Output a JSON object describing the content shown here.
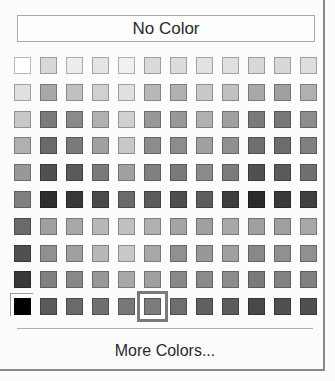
{
  "color_picker": {
    "no_color_label": "No Color",
    "more_colors_label": "More Colors...",
    "selected": {
      "row": 9,
      "col": 5
    },
    "swatches": [
      [
        "#ffffff",
        "#d8d8d8",
        "#ececec",
        "#e4e4e4",
        "#f0f0f0",
        "#dadada",
        "#dcdcdc",
        "#e2e2e2",
        "#e0e0e0",
        "#d8d8d8",
        "#d8d8d8",
        "#dedede"
      ],
      [
        "#e0e0e0",
        "#a8a8a8",
        "#c0c0c0",
        "#d0d0d0",
        "#e0e0e0",
        "#b8b8b8",
        "#b0b0b0",
        "#c8c8c8",
        "#c0c0c0",
        "#a8a8a8",
        "#a0a0a0",
        "#b0b0b0"
      ],
      [
        "#c8c8c8",
        "#7a7a7a",
        "#8a8a8a",
        "#b0b0b0",
        "#d0d0d0",
        "#989898",
        "#989898",
        "#b0b0b0",
        "#a0a0a0",
        "#7a7a7a",
        "#787878",
        "#8c8c8c"
      ],
      [
        "#b0b0b0",
        "#6a6a6a",
        "#7a7a7a",
        "#a0a0a0",
        "#c8c8c8",
        "#8c8c8c",
        "#8c8c8c",
        "#a0a0a0",
        "#909090",
        "#6e6e6e",
        "#6c6c6c",
        "#808080"
      ],
      [
        "#989898",
        "#505050",
        "#5a5a5a",
        "#7a7a7a",
        "#a0a0a0",
        "#808080",
        "#7a7a7a",
        "#8a8a8a",
        "#7c7c7c",
        "#505050",
        "#5a5a5a",
        "#707070"
      ],
      [
        "#808080",
        "#2e2e2e",
        "#383838",
        "#4a4a4a",
        "#6a6a6a",
        "#5c5c5c",
        "#4e4e4e",
        "#5e5e5e",
        "#3e3e3e",
        "#2a2a2a",
        "#3a3a3a",
        "#404040"
      ],
      [
        "#6a6a6a",
        "#a0a0a0",
        "#a8a8a8",
        "#b8b8b8",
        "#c0c0c0",
        "#b0b0b0",
        "#a4a4a4",
        "#a0a0a0",
        "#a8a8a8",
        "#a0a0a0",
        "#a0a0a0",
        "#a8a8a8"
      ],
      [
        "#505050",
        "#909090",
        "#a0a0a0",
        "#b8b8b8",
        "#c8c8c8",
        "#a8a8a8",
        "#909090",
        "#989898",
        "#a0a0a0",
        "#888888",
        "#909090",
        "#909090"
      ],
      [
        "#383838",
        "#808080",
        "#888888",
        "#989898",
        "#a8a8a8",
        "#a0a0a0",
        "#888888",
        "#8a8a8a",
        "#8c8c8c",
        "#7a7a7a",
        "#828282",
        "#808080"
      ],
      [
        "#000000",
        "#5a5a5a",
        "#6a6a6a",
        "#707070",
        "#787878",
        "#7c7c7c",
        "#6e6e6e",
        "#606060",
        "#5c5c5c",
        "#484848",
        "#505050",
        "#505050"
      ]
    ]
  }
}
